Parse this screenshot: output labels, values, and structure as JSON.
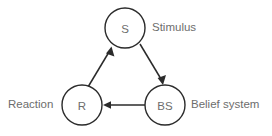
{
  "diagram": {
    "background_color": "#ffffff",
    "stroke_color": "#2b2b2b",
    "text_color": "#6d6d6d",
    "nodes": [
      {
        "id": "stimulus",
        "abbreviation": "S",
        "label": "Stimulus",
        "cx": 125,
        "cy": 28,
        "r": 20
      },
      {
        "id": "reaction",
        "abbreviation": "R",
        "label": "Reaction",
        "cx": 82,
        "cy": 105,
        "r": 20
      },
      {
        "id": "belief-system",
        "abbreviation": "BS",
        "label": "Belief system",
        "cx": 165,
        "cy": 105,
        "r": 20
      }
    ],
    "edges": [
      {
        "id": "stimulus-to-belief-system",
        "from": "stimulus",
        "to": "belief-system",
        "direction": "down-right"
      },
      {
        "id": "belief-system-to-reaction",
        "from": "belief-system",
        "to": "reaction",
        "direction": "left"
      },
      {
        "id": "reaction-to-stimulus",
        "from": "reaction",
        "to": "stimulus",
        "direction": "up-right"
      }
    ]
  }
}
